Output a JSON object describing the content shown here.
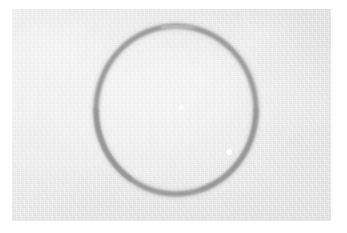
{
  "image": {
    "kind": "scanned-drawing",
    "width": 347,
    "height": 233,
    "scan_margin_color": "#ffffff",
    "alt_text": "A hand-drawn gray circle on a light gray sheet of paper"
  },
  "paper": {
    "name": "paper-sheet",
    "color": "#e9e9e9",
    "left": 12,
    "top": 9,
    "width": 319,
    "height": 212,
    "texture": "fine grain with uneven tone"
  },
  "drawing": {
    "shape": "circle",
    "stroke_color": "#9b9b9b",
    "stroke_width": 5,
    "center_x": 176,
    "center_y": 110,
    "radius_x": 80,
    "radius_y": 84,
    "closed": true,
    "medium": "pencil"
  },
  "specks": [
    {
      "name": "speck-center",
      "x": 181,
      "y": 107,
      "size": 5,
      "color": "#ffffff"
    },
    {
      "name": "speck-lower-right",
      "x": 229,
      "y": 152,
      "size": 6,
      "color": "#ffffff"
    }
  ]
}
